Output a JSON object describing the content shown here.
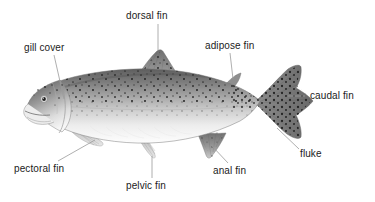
{
  "diagram": {
    "background_color": "#ffffff",
    "label_color": "#1b1b1b",
    "leader_line_color": "#8a8a8a",
    "labels": [
      {
        "id": "dorsal-fin",
        "text": "dorsal fin"
      },
      {
        "id": "gill-cover",
        "text": "gill cover"
      },
      {
        "id": "adipose-fin",
        "text": "adipose fin"
      },
      {
        "id": "caudal-fin",
        "text": "caudal fin"
      },
      {
        "id": "fluke",
        "text": "fluke"
      },
      {
        "id": "pectoral-fin",
        "text": "pectoral fin"
      },
      {
        "id": "pelvic-fin",
        "text": "pelvic fin"
      },
      {
        "id": "anal-fin",
        "text": "anal fin"
      }
    ]
  }
}
